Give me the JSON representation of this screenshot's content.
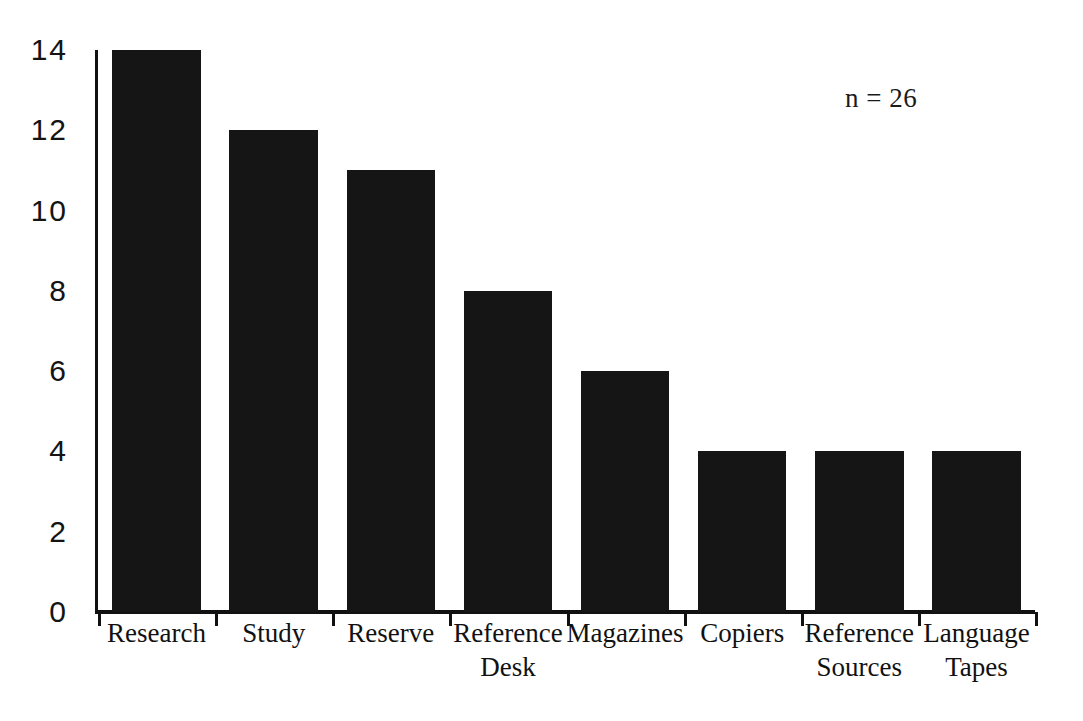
{
  "chart_data": {
    "type": "bar",
    "title": "",
    "subtitle": "",
    "xlabel": "",
    "ylabel": "",
    "categories": [
      "Research",
      "Study",
      "Reserve",
      "Reference Desk",
      "Magazines",
      "Copiers",
      "Reference Sources",
      "Language Tapes"
    ],
    "category_lines": [
      [
        "Research"
      ],
      [
        "Study"
      ],
      [
        "Reserve"
      ],
      [
        "Reference",
        "Desk"
      ],
      [
        "Magazines"
      ],
      [
        "Copiers"
      ],
      [
        "Reference",
        "Sources"
      ],
      [
        "Language",
        "Tapes"
      ]
    ],
    "values": [
      14,
      12,
      11,
      8,
      6,
      4,
      4,
      4
    ],
    "ylim": [
      0,
      14
    ],
    "yticks": [
      0,
      2,
      4,
      6,
      8,
      10,
      12,
      14
    ],
    "ytick_labels": [
      "0",
      "2",
      "4",
      "6",
      "8",
      "10",
      "12",
      "14"
    ],
    "grid": false,
    "legend": false,
    "legend_position": "none",
    "annotations": [
      {
        "text": "n = 26"
      }
    ],
    "bar_color": "#151515",
    "axis_color": "#111111",
    "background_color": "#ffffff"
  }
}
